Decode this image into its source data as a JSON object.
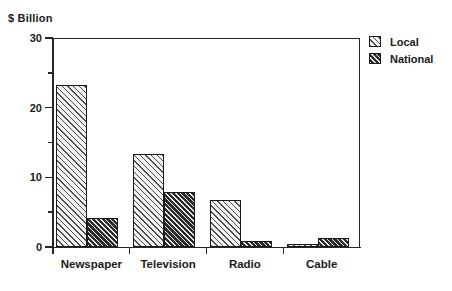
{
  "chart_data": {
    "type": "bar",
    "title": "",
    "subtitle": "",
    "xlabel": "",
    "ylabel": "$ Billion",
    "ylim": [
      0,
      30
    ],
    "grid": false,
    "legend_position": "right-top",
    "categories": [
      "Newspaper",
      "Television",
      "Radio",
      "Cable"
    ],
    "y_major_ticks": [
      0,
      10,
      20,
      30
    ],
    "y_minor_ticks": [
      5,
      15,
      25
    ],
    "y_tick_labels": [
      "0",
      "10",
      "20",
      "30"
    ],
    "series": [
      {
        "name": "Local",
        "pattern": "light-diagonal-hatch",
        "color": "#f2f2f2",
        "values": [
          23.3,
          13.3,
          6.8,
          0.5
        ]
      },
      {
        "name": "National",
        "pattern": "dark-diagonal-hatch",
        "color": "#2b2b2b",
        "values": [
          4.1,
          7.9,
          0.8,
          1.3
        ]
      }
    ]
  },
  "axis_unit_label": "$ Billion",
  "legend": {
    "items": [
      {
        "label": "Local"
      },
      {
        "label": "National"
      }
    ]
  }
}
